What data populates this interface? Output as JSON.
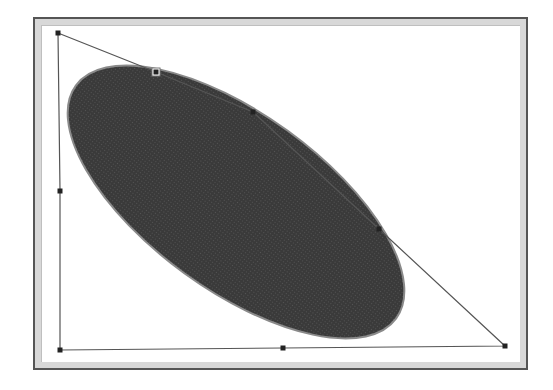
{
  "canvas": {
    "width": 553,
    "height": 390,
    "background": "#ffffff"
  },
  "frame": {
    "border_color": "#555555",
    "band_color": "#d8d8d8"
  },
  "shape": {
    "type": "ellipse",
    "fill": "#3a3a3a",
    "edge": "#8a8a8a",
    "center": [
      236,
      202
    ],
    "rx": 198,
    "ry": 88,
    "rotation_deg": 36
  },
  "path": {
    "stroke": "#555555",
    "points": [
      [
        58,
        33
      ],
      [
        156,
        72
      ],
      [
        253,
        112
      ],
      [
        379,
        229
      ],
      [
        505,
        346
      ],
      [
        283,
        348
      ],
      [
        60,
        350
      ],
      [
        60,
        191
      ]
    ],
    "handles": [
      {
        "name": "vertex-top-left",
        "x": 58,
        "y": 33
      },
      {
        "name": "handle-top",
        "x": 156,
        "y": 72,
        "hollow": true
      },
      {
        "name": "vertex-upper",
        "x": 253,
        "y": 112
      },
      {
        "name": "vertex-right",
        "x": 379,
        "y": 229
      },
      {
        "name": "vertex-bottom-right",
        "x": 505,
        "y": 346
      },
      {
        "name": "handle-bottom-mid",
        "x": 283,
        "y": 348
      },
      {
        "name": "vertex-bottom-left",
        "x": 60,
        "y": 350
      },
      {
        "name": "handle-left-mid",
        "x": 60,
        "y": 191
      }
    ]
  }
}
